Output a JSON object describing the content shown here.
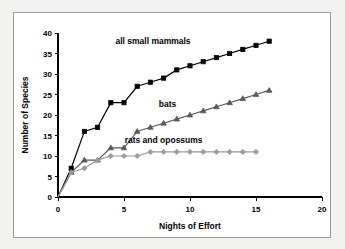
{
  "chart_data": {
    "type": "line",
    "title": "",
    "xlabel": "Nights of Effort",
    "ylabel": "Number of Species",
    "xlim": [
      0,
      20
    ],
    "ylim": [
      0,
      40
    ],
    "xticks": [
      0,
      5,
      10,
      15,
      20
    ],
    "yticks": [
      0,
      5,
      10,
      15,
      20,
      25,
      30,
      35,
      40
    ],
    "xtick_labels": [
      "0",
      "5",
      "10",
      "15",
      "20"
    ],
    "ytick_labels": [
      "0",
      "5",
      "10",
      "15",
      "20",
      "25",
      "30",
      "35",
      "40"
    ],
    "grid": false,
    "legend_position": "inline-annotations",
    "series": [
      {
        "name": "all small mammals",
        "marker": "square",
        "color": "#000000",
        "line_color": "#000000",
        "label_x": 7.2,
        "label_y": 37.2,
        "x": [
          0,
          1,
          2,
          3,
          4,
          5,
          6,
          7,
          8,
          9,
          10,
          11,
          12,
          13,
          14,
          15,
          16
        ],
        "y": [
          0,
          7,
          16,
          17,
          23,
          23,
          27,
          28,
          29,
          31,
          32,
          33,
          34,
          35,
          36,
          37,
          38
        ]
      },
      {
        "name": "bats",
        "marker": "triangle",
        "color": "#595959",
        "line_color": "#595959",
        "label_x": 8.3,
        "label_y": 22.0,
        "x": [
          0,
          1,
          2,
          3,
          4,
          5,
          6,
          7,
          8,
          9,
          10,
          11,
          12,
          13,
          14,
          15,
          16
        ],
        "y": [
          0,
          6,
          9,
          9,
          12,
          12,
          16,
          17,
          18,
          19,
          20,
          21,
          22,
          23,
          24,
          25,
          26
        ]
      },
      {
        "name": "rats and opossums",
        "marker": "diamond",
        "color": "#9a9a9a",
        "line_color": "#9a9a9a",
        "label_x": 8.0,
        "label_y": 13.2,
        "x": [
          0,
          1,
          2,
          3,
          4,
          5,
          6,
          7,
          8,
          9,
          10,
          11,
          12,
          13,
          14,
          15
        ],
        "y": [
          0,
          6,
          7,
          9,
          10,
          10,
          10,
          11,
          11,
          11,
          11,
          11,
          11,
          11,
          11,
          11
        ]
      }
    ]
  },
  "colors": {
    "page_background": "#f2f2f0",
    "plot_background": "#ffffff",
    "frame_border": "#9a9a9a",
    "axis": "#000000",
    "series_all_small_mammals": "#000000",
    "series_bats": "#595959",
    "series_rats_and_opossums": "#9a9a9a"
  }
}
